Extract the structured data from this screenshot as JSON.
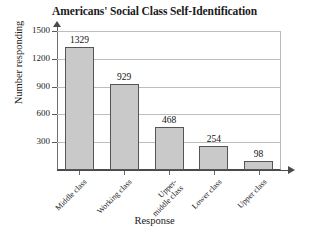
{
  "chart_data": {
    "type": "bar",
    "title": "Americans' Social Class Self-Identification",
    "xlabel": "Response",
    "ylabel": "Number responding",
    "categories": [
      "Middle class",
      "Working class",
      "Upper-middle class",
      "Lower class",
      "Upper class"
    ],
    "category_lines": [
      [
        "Middle class"
      ],
      [
        "Working class"
      ],
      [
        "Upper-",
        "middle class"
      ],
      [
        "Lower class"
      ],
      [
        "Upper class"
      ]
    ],
    "values": [
      1329,
      929,
      468,
      254,
      98
    ],
    "value_labels": [
      "1329",
      "929",
      "468",
      "254",
      "98"
    ],
    "ylim": [
      0,
      1500
    ],
    "yticks": [
      300,
      600,
      900,
      1200,
      1500
    ],
    "ytick_labels": [
      "300",
      "600",
      "900",
      "1200",
      "1500"
    ],
    "grid": true,
    "legend": null,
    "colors": {
      "bar_fill": "#c9c9c9",
      "bar_border": "#555555",
      "gridline": "#bdbdbd",
      "axis": "#4a4a4a",
      "text": "#1a1a1a",
      "background": "#ffffff"
    }
  }
}
